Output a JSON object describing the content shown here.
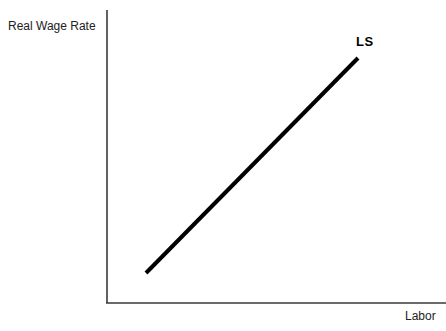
{
  "chart_data": {
    "type": "line",
    "title": "",
    "subtitle": "",
    "xlabel": "Labor",
    "ylabel": "Real Wage Rate",
    "grid": false,
    "legend": "none",
    "annotations": [
      {
        "name": "curve-label",
        "text": "LS",
        "meaning": "Labor Supply curve",
        "x": 358,
        "y": 58
      }
    ],
    "axes": {
      "x": {
        "label": "Labor",
        "ticks": [],
        "tick_labels": [],
        "origin_px": 106,
        "end_px": 446,
        "baseline_px": 303
      },
      "y": {
        "label": "Real Wage Rate",
        "ticks": [],
        "tick_labels": [],
        "top_px": 10,
        "bottom_px": 303,
        "axis_px": 107
      }
    },
    "series": [
      {
        "name": "LS",
        "label": "LS",
        "description": "Upward sloping labor supply curve",
        "color": "#000000",
        "line_width": 4,
        "x": [
          146,
          358
        ],
        "y": [
          273,
          58
        ],
        "points": [
          {
            "x": 146,
            "y": 273
          },
          {
            "x": 358,
            "y": 58
          }
        ]
      }
    ]
  },
  "colors": {
    "background": "#ffffff",
    "axis": "#3a3a3a",
    "curve": "#000000",
    "label_text": "#222222",
    "curve_label_text": "#000000"
  }
}
